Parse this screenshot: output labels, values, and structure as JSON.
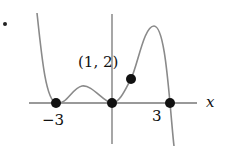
{
  "diagram": {
    "point_label": "(1, 2)",
    "x_axis_label": "x",
    "tick_labels": [
      "−3",
      "3"
    ],
    "points": [
      {
        "x": -3,
        "y": 0
      },
      {
        "x": 0,
        "y": 0
      },
      {
        "x": 3,
        "y": 0
      },
      {
        "x": 1,
        "y": 2
      }
    ],
    "curve_color": "#8a8a8a",
    "axis_color": "#777777",
    "dot_color": "#111111"
  }
}
